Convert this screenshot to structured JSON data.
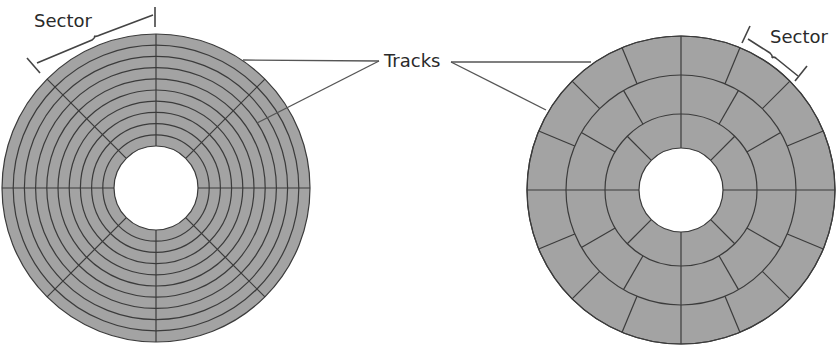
{
  "diagram": {
    "colors": {
      "disk_fill": "#a3a3a3",
      "line": "#3b3b3b",
      "leader": "#555555",
      "hole": "#ffffff",
      "text": "#2a2a2a"
    },
    "labels": {
      "tracks": "Tracks",
      "sector_left": "Sector",
      "sector_right": "Sector"
    },
    "left_disk": {
      "title": "Fixed sectors per track (constant angular)",
      "center": [
        156,
        188
      ],
      "outer_radius": 154,
      "hole_radius": 42,
      "track_count": 10,
      "sectors_per_track": 8
    },
    "right_disk": {
      "title": "Zoned recording (more sectors on outer tracks)",
      "center": [
        681,
        190
      ],
      "outer_radius": 154,
      "hole_radius": 42,
      "zones": [
        {
          "inner_r": 42,
          "outer_r": 76,
          "sectors": 8
        },
        {
          "inner_r": 76,
          "outer_r": 115,
          "sectors": 12
        },
        {
          "inner_r": 115,
          "outer_r": 154,
          "sectors": 16
        }
      ]
    }
  }
}
